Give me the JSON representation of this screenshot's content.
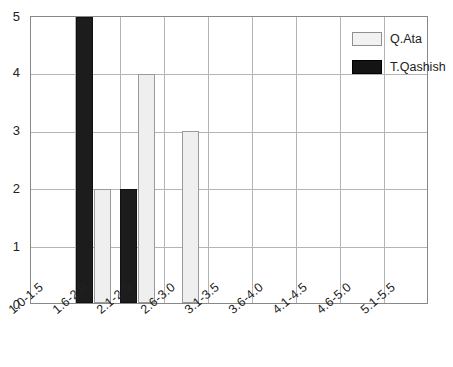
{
  "chart_data": {
    "type": "bar",
    "title": "",
    "subtitle": "",
    "xlabel": "",
    "ylabel": "",
    "ylim": [
      0,
      5
    ],
    "yticks": [
      "0",
      "1",
      "2",
      "3",
      "4",
      "5"
    ],
    "grid": true,
    "legend_position": "top-right",
    "categories": [
      "1.0-1.5",
      "1.6-2.0",
      "2.1-2.5",
      "2.6-3.0",
      "3.1-3.5",
      "3.6-4.0",
      "4.1-4.5",
      "4.6-5.0",
      "5.1-5.5"
    ],
    "series": [
      {
        "name": "Q.Ata",
        "color": "#efefef",
        "values": [
          0,
          2,
          4,
          3,
          0,
          0,
          0,
          0,
          0
        ]
      },
      {
        "name": "T.Qashish",
        "color": "#1c1c1c",
        "values": [
          0,
          5,
          2,
          0,
          0,
          0,
          0,
          0,
          0
        ]
      }
    ]
  },
  "legend": {
    "items": [
      {
        "label": "Q.Ata",
        "swatch": "light-swatch-icon"
      },
      {
        "label": "T.Qashish",
        "swatch": "dark-swatch-icon"
      }
    ]
  },
  "axes": {
    "y_ticks": [
      "5",
      "4",
      "3",
      "2",
      "1",
      "0"
    ],
    "x_ticks": [
      "1.0-1.5",
      "1.6-2.0",
      "2.1-2.5",
      "2.6-3.0",
      "3.1-3.5",
      "3.6-4.0",
      "4.1-4.5",
      "4.6-5.0",
      "5.1-5.5"
    ]
  }
}
